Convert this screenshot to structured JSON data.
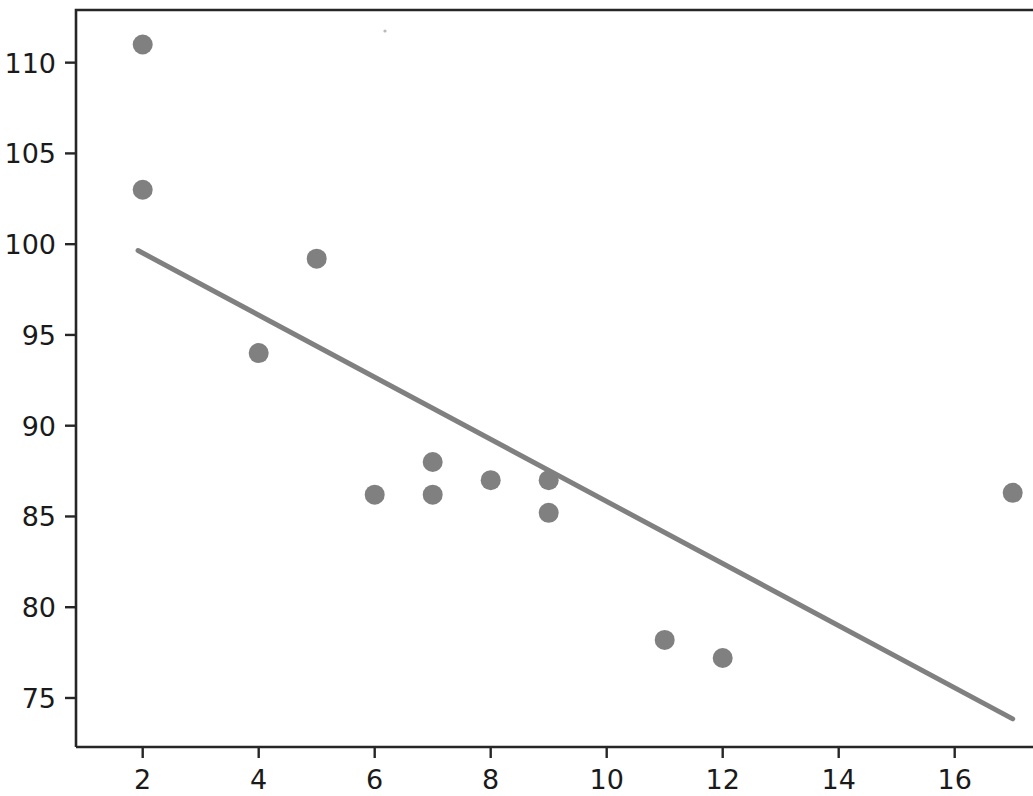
{
  "figure": {
    "background_color": "#ffffff",
    "width": 1033,
    "height": 796
  },
  "axes": {
    "spine_color": "#262626",
    "x_ticks": [
      "2",
      "4",
      "6",
      "8",
      "10",
      "12",
      "14",
      "16"
    ],
    "y_ticks": [
      "75",
      "80",
      "85",
      "90",
      "95",
      "100",
      "105",
      "110"
    ],
    "x_tick_values": [
      2,
      4,
      6,
      8,
      10,
      12,
      14,
      16
    ],
    "y_tick_values": [
      75,
      80,
      85,
      90,
      95,
      100,
      105,
      110
    ]
  },
  "chart_data": {
    "type": "scatter",
    "title": "",
    "xlabel": "",
    "ylabel": "",
    "xlim": [
      0.85,
      17.35
    ],
    "ylim": [
      72.3,
      112.9
    ],
    "grid": false,
    "legend": "none",
    "marker": {
      "color": "#808080",
      "size": 20,
      "shape": "circle"
    },
    "points": [
      {
        "x": 2,
        "y": 111.0
      },
      {
        "x": 2,
        "y": 103.0
      },
      {
        "x": 4,
        "y": 94.0
      },
      {
        "x": 5,
        "y": 99.2
      },
      {
        "x": 6,
        "y": 86.2
      },
      {
        "x": 7,
        "y": 88.0
      },
      {
        "x": 7,
        "y": 86.2
      },
      {
        "x": 8,
        "y": 87.0
      },
      {
        "x": 9,
        "y": 87.0
      },
      {
        "x": 9,
        "y": 85.2
      },
      {
        "x": 11,
        "y": 78.2
      },
      {
        "x": 12,
        "y": 77.2
      },
      {
        "x": 17,
        "y": 86.3
      }
    ],
    "trendline": {
      "color": "#808080",
      "width": 5,
      "x_start": 1.92,
      "y_start": 99.65,
      "x_end": 17.0,
      "y_end": 73.85,
      "slope": -1.711,
      "intercept": 102.94
    }
  }
}
